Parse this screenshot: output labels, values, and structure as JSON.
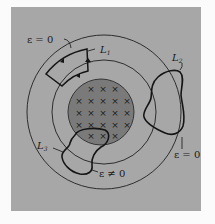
{
  "figure": {
    "background": "#fbfbfb",
    "panel_color": "#a7a7a7",
    "disk_color": "#7a7a7a",
    "line_color": "#1a1a1a"
  },
  "labels": {
    "emf_zero_top": "ε = 0",
    "emf_zero_right": "ε = 0",
    "emf_nonzero": "ε ≠ 0",
    "loop1": "L",
    "loop1_sub": "1",
    "loop2": "L",
    "loop2_sub": "2",
    "loop3": "L",
    "loop3_sub": "3"
  },
  "field": {
    "symbol": "×",
    "rows": [
      3,
      5,
      5,
      5,
      3
    ]
  }
}
